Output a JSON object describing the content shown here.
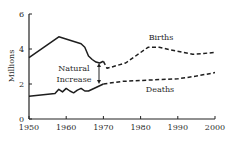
{
  "chart_data": {
    "type": "line",
    "title": "",
    "xlabel": "",
    "ylabel": "Millions",
    "xlim": [
      1950,
      2000
    ],
    "ylim": [
      0,
      6
    ],
    "x_ticks": [
      1950,
      1960,
      1970,
      1980,
      1990,
      2000
    ],
    "y_ticks": [
      0,
      2,
      4,
      6
    ],
    "grid": false,
    "legend": "inline labels",
    "series": [
      {
        "name": "Births",
        "historical": {
          "x": [
            1950,
            1958,
            1964,
            1965,
            1966,
            1967,
            1968,
            1969,
            1970
          ],
          "y": [
            3.5,
            4.7,
            4.3,
            4.1,
            3.6,
            3.4,
            3.25,
            3.2,
            3.3
          ]
        },
        "projected": {
          "x": [
            1970,
            1971,
            1976,
            1982,
            1985,
            1988,
            1994,
            1997,
            2000
          ],
          "y": [
            3.3,
            2.9,
            3.2,
            4.1,
            4.1,
            3.95,
            3.7,
            3.75,
            3.8
          ]
        },
        "style": {
          "historical": "solid",
          "projected": "dashed"
        }
      },
      {
        "name": "Deaths",
        "historical": {
          "x": [
            1950,
            1957,
            1958,
            1959,
            1960,
            1961,
            1962,
            1963,
            1964,
            1965,
            1966,
            1968,
            1970
          ],
          "y": [
            1.3,
            1.45,
            1.7,
            1.55,
            1.75,
            1.6,
            1.5,
            1.65,
            1.75,
            1.6,
            1.6,
            1.8,
            2.0
          ]
        },
        "projected": {
          "x": [
            1970,
            1975,
            1980,
            1985,
            1990,
            1995,
            2000
          ],
          "y": [
            2.0,
            2.15,
            2.2,
            2.25,
            2.3,
            2.45,
            2.65
          ]
        },
        "style": {
          "historical": "solid",
          "projected": "dashed"
        }
      }
    ],
    "annotations": [
      {
        "text": "Natural Increase",
        "type": "double-arrow",
        "x": 1969,
        "y_from": 3.2,
        "y_to": 2.0
      },
      {
        "text": "Births",
        "x": 1985,
        "y": 4.6
      },
      {
        "text": "Deaths",
        "x": 1985,
        "y": 1.7
      }
    ]
  },
  "labels": {
    "y_axis": "Millions",
    "births": "Births",
    "deaths": "Deaths",
    "natural_line1": "Natural",
    "natural_line2": "Increase",
    "y_ticks": [
      "0",
      "2",
      "4",
      "6"
    ],
    "x_ticks": [
      "1950",
      "1960",
      "1970",
      "1980",
      "1990",
      "2000"
    ]
  }
}
